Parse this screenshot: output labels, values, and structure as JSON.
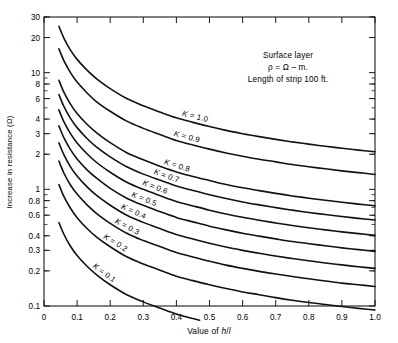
{
  "chart_data": {
    "type": "line",
    "title": "",
    "xlabel": "Value of h/l",
    "ylabel": "Increase in resistance (Ω)",
    "xscale": "linear",
    "yscale": "log",
    "xlim": [
      0,
      1.0
    ],
    "ylim": [
      0.1,
      30
    ],
    "grid": false,
    "legend": "inline-curve-labels",
    "xticks": [
      "0",
      "0.1",
      "0.2",
      "0.3",
      "0.4",
      "0.5",
      "0.6",
      "0.7",
      "0.8",
      "0.9",
      "1.0"
    ],
    "xtick_values": [
      0,
      0.1,
      0.2,
      0.3,
      0.4,
      0.5,
      0.6,
      0.7,
      0.8,
      0.9,
      1.0
    ],
    "yticks": [
      "30",
      "20",
      "10",
      "8",
      "6",
      "4",
      "3",
      "2",
      "1",
      "0.8",
      "0.6",
      "0.4",
      "0.3",
      "0.2",
      "0.1"
    ],
    "ytick_values": [
      30,
      20,
      10,
      8,
      6,
      4,
      3,
      2,
      1,
      0.8,
      0.6,
      0.4,
      0.3,
      0.2,
      0.1
    ],
    "annotation": {
      "line1": "Surface layer",
      "line2": "ρ = Ω – m.",
      "line3": "Length of strip  100 ft."
    },
    "series": [
      {
        "name": "K = 1.0",
        "label": "K = 1.0",
        "K": 1.0,
        "x": [
          0.045,
          0.06,
          0.08,
          0.1,
          0.13,
          0.16,
          0.2,
          0.25,
          0.3,
          0.35,
          0.4,
          0.45,
          0.5,
          0.55,
          0.6,
          0.65,
          0.7,
          0.75,
          0.8,
          0.85,
          0.9,
          0.95,
          1.0
        ],
        "y": [
          25.0,
          19.8,
          15.6,
          13.0,
          10.5,
          8.8,
          7.3,
          6.0,
          5.2,
          4.6,
          4.1,
          3.75,
          3.45,
          3.2,
          3.0,
          2.83,
          2.68,
          2.55,
          2.44,
          2.34,
          2.25,
          2.17,
          2.1
        ]
      },
      {
        "name": "K = 0.9",
        "label": "K = 0.9",
        "K": 0.9,
        "x": [
          0.045,
          0.06,
          0.08,
          0.1,
          0.13,
          0.16,
          0.2,
          0.25,
          0.3,
          0.35,
          0.4,
          0.45,
          0.5,
          0.55,
          0.6,
          0.65,
          0.7,
          0.75,
          0.8,
          0.85,
          0.9,
          0.95,
          1.0
        ],
        "y": [
          16.0,
          12.7,
          10.0,
          8.3,
          6.7,
          5.6,
          4.67,
          3.84,
          3.33,
          2.95,
          2.62,
          2.4,
          2.21,
          2.05,
          1.92,
          1.81,
          1.72,
          1.63,
          1.56,
          1.5,
          1.44,
          1.39,
          1.34
        ]
      },
      {
        "name": "K = 0.8",
        "label": "K = 0.8",
        "K": 0.8,
        "x": [
          0.045,
          0.06,
          0.08,
          0.1,
          0.13,
          0.16,
          0.2,
          0.25,
          0.3,
          0.35,
          0.4,
          0.45,
          0.5,
          0.55,
          0.6,
          0.65,
          0.7,
          0.75,
          0.8,
          0.85,
          0.9,
          0.95,
          1.0
        ],
        "y": [
          8.6,
          6.8,
          5.38,
          4.47,
          3.61,
          3.03,
          2.51,
          2.06,
          1.79,
          1.58,
          1.41,
          1.29,
          1.19,
          1.1,
          1.03,
          0.975,
          0.923,
          0.878,
          0.84,
          0.806,
          0.775,
          0.747,
          0.723
        ]
      },
      {
        "name": "K = 0.7",
        "label": "K = 0.7",
        "K": 0.7,
        "x": [
          0.045,
          0.06,
          0.08,
          0.1,
          0.13,
          0.16,
          0.2,
          0.25,
          0.3,
          0.35,
          0.4,
          0.45,
          0.5,
          0.55,
          0.6,
          0.65,
          0.7,
          0.75,
          0.8,
          0.85,
          0.9,
          0.95,
          1.0
        ],
        "y": [
          6.5,
          5.14,
          4.06,
          3.38,
          2.73,
          2.29,
          1.9,
          1.56,
          1.35,
          1.2,
          1.07,
          0.977,
          0.897,
          0.833,
          0.78,
          0.736,
          0.697,
          0.663,
          0.634,
          0.608,
          0.585,
          0.564,
          0.546
        ]
      },
      {
        "name": "K = 0.6",
        "label": "K = 0.6",
        "K": 0.6,
        "x": [
          0.045,
          0.06,
          0.08,
          0.1,
          0.13,
          0.16,
          0.2,
          0.25,
          0.3,
          0.35,
          0.4,
          0.45,
          0.5,
          0.55,
          0.6,
          0.65,
          0.7,
          0.75,
          0.8,
          0.85,
          0.9,
          0.95,
          1.0
        ],
        "y": [
          4.8,
          3.8,
          3.0,
          2.5,
          2.02,
          1.69,
          1.4,
          1.15,
          1.0,
          0.885,
          0.787,
          0.721,
          0.663,
          0.615,
          0.576,
          0.544,
          0.515,
          0.49,
          0.468,
          0.449,
          0.432,
          0.417,
          0.403
        ]
      },
      {
        "name": "K = 0.5",
        "label": "K = 0.5",
        "K": 0.5,
        "x": [
          0.045,
          0.06,
          0.08,
          0.1,
          0.13,
          0.16,
          0.2,
          0.25,
          0.3,
          0.35,
          0.4,
          0.45,
          0.5,
          0.55,
          0.6,
          0.65,
          0.7,
          0.75,
          0.8,
          0.85,
          0.9,
          0.95,
          1.0
        ],
        "y": [
          3.5,
          2.77,
          2.19,
          1.82,
          1.47,
          1.24,
          1.02,
          0.84,
          0.729,
          0.645,
          0.574,
          0.526,
          0.483,
          0.449,
          0.42,
          0.397,
          0.376,
          0.357,
          0.342,
          0.328,
          0.315,
          0.304,
          0.294
        ]
      },
      {
        "name": "K = 0.4",
        "label": "K = 0.4",
        "K": 0.4,
        "x": [
          0.045,
          0.06,
          0.08,
          0.1,
          0.13,
          0.16,
          0.2,
          0.25,
          0.3,
          0.35,
          0.4,
          0.45,
          0.5,
          0.55,
          0.6,
          0.65,
          0.7,
          0.75,
          0.8,
          0.85,
          0.9,
          0.95,
          1.0
        ],
        "y": [
          2.5,
          1.98,
          1.56,
          1.3,
          1.05,
          0.882,
          0.731,
          0.6,
          0.521,
          0.461,
          0.41,
          0.375,
          0.345,
          0.32,
          0.3,
          0.283,
          0.268,
          0.255,
          0.244,
          0.234,
          0.225,
          0.217,
          0.21
        ]
      },
      {
        "name": "K = 0.3",
        "label": "K = 0.3",
        "K": 0.3,
        "x": [
          0.045,
          0.06,
          0.08,
          0.1,
          0.13,
          0.16,
          0.2,
          0.25,
          0.3,
          0.35,
          0.4,
          0.45,
          0.5,
          0.55,
          0.6,
          0.65,
          0.7,
          0.75,
          0.8,
          0.85,
          0.9,
          0.95,
          1.0
        ],
        "y": [
          1.75,
          1.38,
          1.09,
          0.91,
          0.735,
          0.617,
          0.511,
          0.42,
          0.364,
          0.323,
          0.287,
          0.263,
          0.242,
          0.224,
          0.21,
          0.198,
          0.188,
          0.179,
          0.171,
          0.164,
          0.157,
          0.152,
          0.147
        ]
      },
      {
        "name": "K = 0.2",
        "label": "K = 0.2",
        "K": 0.2,
        "x": [
          0.045,
          0.06,
          0.08,
          0.1,
          0.13,
          0.16,
          0.2,
          0.25,
          0.3,
          0.35,
          0.4,
          0.45,
          0.5,
          0.55,
          0.6,
          0.65,
          0.7,
          0.75,
          0.8,
          0.85,
          0.9,
          0.95,
          1.0
        ],
        "y": [
          1.1,
          0.87,
          0.688,
          0.572,
          0.462,
          0.388,
          0.322,
          0.264,
          0.229,
          0.203,
          0.18,
          0.165,
          0.152,
          0.141,
          0.132,
          0.125,
          0.118,
          0.112,
          0.107,
          0.103,
          0.099,
          0.0955,
          0.0924
        ]
      },
      {
        "name": "K = 0.1",
        "label": "K = 0.1",
        "K": 0.1,
        "x": [
          0.045,
          0.06,
          0.08,
          0.1,
          0.13,
          0.16,
          0.2,
          0.25,
          0.3,
          0.35,
          0.4,
          0.45,
          0.47
        ],
        "y": [
          0.52,
          0.412,
          0.325,
          0.271,
          0.219,
          0.184,
          0.152,
          0.125,
          0.1085,
          0.0961,
          0.0855,
          0.0782,
          0.0755
        ]
      }
    ]
  }
}
